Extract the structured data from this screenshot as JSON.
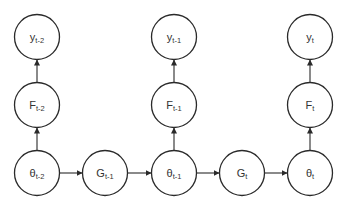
{
  "diagram": {
    "type": "graphical-model",
    "colors": {
      "stroke": "#2a2a2a",
      "text": "#333333",
      "background": "#ffffff"
    },
    "nodes": [
      {
        "id": "y_t-2",
        "base": "y",
        "sub": "t-2",
        "cx": 37,
        "cy": 37
      },
      {
        "id": "F_t-2",
        "base": "F",
        "sub": "t-2",
        "cx": 37,
        "cy": 105
      },
      {
        "id": "theta_t-2",
        "base": "θ",
        "sub": "t-2",
        "cx": 37,
        "cy": 173
      },
      {
        "id": "G_t-1",
        "base": "G",
        "sub": "t-1",
        "cx": 105,
        "cy": 173
      },
      {
        "id": "y_t-1",
        "base": "y",
        "sub": "t-1",
        "cx": 174,
        "cy": 37
      },
      {
        "id": "F_t-1",
        "base": "F",
        "sub": "t-1",
        "cx": 174,
        "cy": 105
      },
      {
        "id": "theta_t-1",
        "base": "θ",
        "sub": "t-1",
        "cx": 174,
        "cy": 173
      },
      {
        "id": "G_t",
        "base": "G",
        "sub": "t",
        "cx": 242,
        "cy": 173
      },
      {
        "id": "y_t",
        "base": "y",
        "sub": "t",
        "cx": 310,
        "cy": 37
      },
      {
        "id": "F_t",
        "base": "F",
        "sub": "t",
        "cx": 310,
        "cy": 105
      },
      {
        "id": "theta_t",
        "base": "θ",
        "sub": "t",
        "cx": 310,
        "cy": 173
      }
    ],
    "edges": [
      {
        "from": "theta_t-2",
        "to": "F_t-2"
      },
      {
        "from": "F_t-2",
        "to": "y_t-2"
      },
      {
        "from": "theta_t-2",
        "to": "G_t-1"
      },
      {
        "from": "G_t-1",
        "to": "theta_t-1"
      },
      {
        "from": "theta_t-1",
        "to": "F_t-1"
      },
      {
        "from": "F_t-1",
        "to": "y_t-1"
      },
      {
        "from": "theta_t-1",
        "to": "G_t"
      },
      {
        "from": "G_t",
        "to": "theta_t"
      },
      {
        "from": "theta_t",
        "to": "F_t"
      },
      {
        "from": "F_t",
        "to": "y_t"
      }
    ],
    "node_radius": 22.5
  },
  "labels": {
    "y_t-2": {
      "base": "y",
      "sub": "t-2"
    },
    "F_t-2": {
      "base": "F",
      "sub": "t-2"
    },
    "theta_t-2": {
      "base": "θ",
      "sub": "t-2"
    },
    "G_t-1": {
      "base": "G",
      "sub": "t-1"
    },
    "y_t-1": {
      "base": "y",
      "sub": "t-1"
    },
    "F_t-1": {
      "base": "F",
      "sub": "t-1"
    },
    "theta_t-1": {
      "base": "θ",
      "sub": "t-1"
    },
    "G_t": {
      "base": "G",
      "sub": "t"
    },
    "y_t": {
      "base": "y",
      "sub": "t"
    },
    "F_t": {
      "base": "F",
      "sub": "t"
    },
    "theta_t": {
      "base": "θ",
      "sub": "t"
    }
  }
}
